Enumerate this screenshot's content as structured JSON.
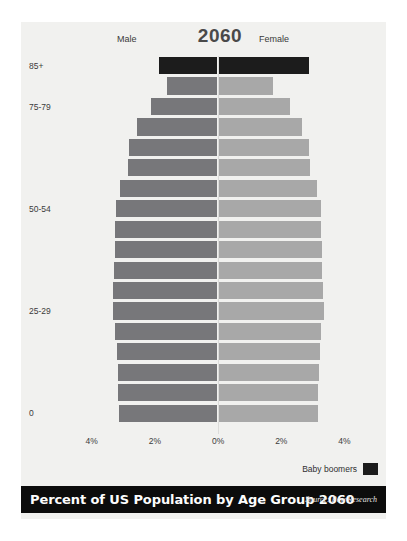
{
  "header": {
    "male_label": "Male",
    "female_label": "Female",
    "year": "2060"
  },
  "legend": {
    "label": "Baby boomers",
    "color": "#1c1c1c"
  },
  "footer": {
    "title": "Percent of US Population by Age Group 2060",
    "source": "Source: Pew Research"
  },
  "colors": {
    "male": "#77777a",
    "female": "#a8a8a8",
    "boomer": "#1c1c1c",
    "background": "#f1f1ef",
    "footer_bg": "#0c0c0c"
  },
  "chart_data": {
    "type": "bar",
    "subtype": "population-pyramid",
    "title": "Percent of US Population by Age Group 2060",
    "xlabel": "",
    "ylabel": "",
    "xlim": [
      -4.6,
      4.6
    ],
    "xticks": [
      -4,
      -2,
      0,
      2,
      4
    ],
    "xtick_labels": [
      "4%",
      "2%",
      "0%",
      "2%",
      "4%"
    ],
    "grid": false,
    "legend_position": "bottom-right",
    "categories": [
      "85+",
      "80-84",
      "75-79",
      "70-74",
      "65-69",
      "60-64",
      "55-59",
      "50-54",
      "45-49",
      "40-44",
      "35-39",
      "30-34",
      "25-29",
      "20-24",
      "15-19",
      "10-14",
      "5-9",
      "0-4"
    ],
    "visible_tick_labels": [
      "85+",
      "75-79",
      "50-54",
      "25-29",
      "0"
    ],
    "series": [
      {
        "name": "Male",
        "color": "#77777a",
        "values": [
          1.83,
          1.58,
          2.09,
          2.53,
          2.78,
          2.8,
          3.05,
          3.19,
          3.21,
          3.22,
          3.25,
          3.28,
          3.3,
          3.22,
          3.16,
          3.14,
          3.12,
          3.1
        ]
      },
      {
        "name": "Female",
        "color": "#a8a8a8",
        "values": [
          2.82,
          1.71,
          2.22,
          2.62,
          2.84,
          2.86,
          3.09,
          3.21,
          3.23,
          3.24,
          3.26,
          3.29,
          3.31,
          3.23,
          3.17,
          3.15,
          3.13,
          3.11
        ]
      }
    ],
    "highlighted_categories": [
      "85+"
    ],
    "highlight_name": "Baby boomers",
    "highlight_color": "#1c1c1c"
  }
}
